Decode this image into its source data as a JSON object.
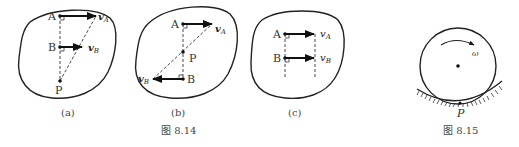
{
  "figures": {
    "fig_8_14": {
      "caption": "图 8.14",
      "panels": [
        {
          "id": "a",
          "label": "(a)",
          "points": {
            "A": "A",
            "B": "B",
            "P": "P"
          },
          "vectors": {
            "vA": "v",
            "vA_sub": "A",
            "vB": "v",
            "vB_sub": "B"
          }
        },
        {
          "id": "b",
          "label": "(b)",
          "points": {
            "A": "A",
            "B": "B",
            "P": "P"
          },
          "vectors": {
            "vA": "v",
            "vA_sub": "A",
            "vB": "v",
            "vB_sub": "B"
          }
        },
        {
          "id": "c",
          "label": "(c)",
          "points": {
            "A": "A",
            "B": "B"
          },
          "vectors": {
            "vA": "v",
            "vA_sub": "A",
            "vB": "v",
            "vB_sub": "B"
          }
        }
      ]
    },
    "fig_8_15": {
      "caption": "图 8.15",
      "omega": "ω",
      "contact_point": "P"
    }
  },
  "colors": {
    "ink": "#222222",
    "background": "#ffffff"
  }
}
